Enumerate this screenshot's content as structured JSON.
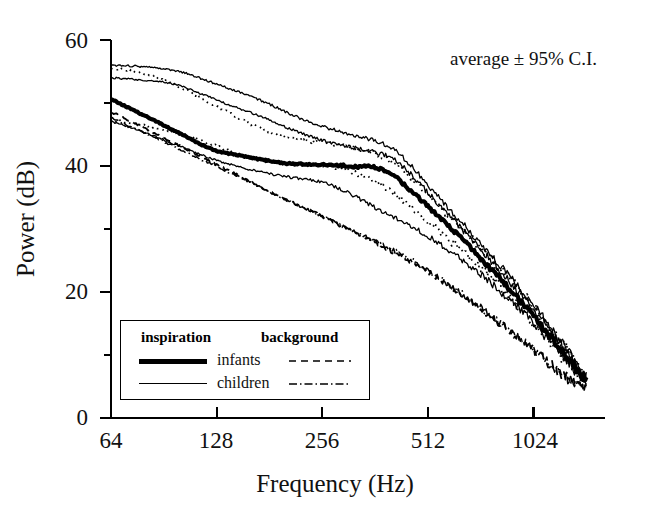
{
  "figure": {
    "annotation": "average ± 95% C.I.",
    "background_color": "#ffffff",
    "ink_color": "#000000"
  },
  "axes": {
    "ylabel": "Power (dB)",
    "xlabel": "Frequency (Hz)",
    "y_ticks": [
      "60",
      "40",
      "20",
      "0"
    ],
    "x_ticks": [
      "64",
      "128",
      "256",
      "512",
      "1024"
    ]
  },
  "legend": {
    "header_left": "inspiration",
    "header_right": "background",
    "rows": [
      {
        "name": "infants",
        "inspiration_style": "thick-solid",
        "background_style": "dashed"
      },
      {
        "name": "children",
        "inspiration_style": "thin-solid",
        "background_style": "dash-dot"
      }
    ]
  },
  "chart_data": {
    "type": "line",
    "title": "",
    "xlabel": "Frequency (Hz)",
    "ylabel": "Power (dB)",
    "xscale": "log2",
    "xlim": [
      64,
      1450
    ],
    "ylim": [
      0,
      60
    ],
    "yticks": [
      0,
      20,
      40,
      60
    ],
    "yticks_minor": [
      10,
      30,
      50
    ],
    "xticks": [
      64,
      128,
      256,
      512,
      1024
    ],
    "grid": false,
    "legend_position": "lower-left",
    "annotation": "average ± 95% C.I.",
    "x": [
      64,
      72,
      81,
      91,
      102,
      114,
      128,
      144,
      161,
      181,
      203,
      228,
      256,
      287,
      322,
      362,
      406,
      456,
      512,
      574,
      645,
      724,
      812,
      912,
      1024,
      1149,
      1290,
      1448
    ],
    "series": [
      {
        "name": "infants inspiration (average)",
        "style": "thick-solid",
        "values": [
          50.5,
          49.2,
          47.8,
          46.4,
          45.0,
          43.6,
          42.4,
          41.8,
          41.3,
          40.8,
          40.4,
          40.3,
          40.2,
          40.1,
          39.9,
          39.8,
          38.6,
          36.2,
          33.6,
          30.9,
          28.2,
          25.3,
          22.4,
          19.4,
          16.1,
          12.8,
          9.3,
          6.2
        ]
      },
      {
        "name": "infants inspiration upper 95% C.I.",
        "style": "dotted",
        "values": [
          55.5,
          55.2,
          54.6,
          53.6,
          52.4,
          51.0,
          49.5,
          48.0,
          46.6,
          45.4,
          44.5,
          44.0,
          43.7,
          43.3,
          42.8,
          42.0,
          40.6,
          38.2,
          35.5,
          32.6,
          29.8,
          26.9,
          24.0,
          20.9,
          17.5,
          14.1,
          10.4,
          7.0
        ]
      },
      {
        "name": "infants inspiration lower 95% C.I.",
        "style": "dotted",
        "values": [
          47.2,
          46.9,
          46.4,
          45.8,
          45.1,
          44.2,
          43.2,
          42.2,
          41.3,
          40.7,
          40.4,
          40.2,
          40.0,
          39.6,
          38.8,
          37.6,
          35.8,
          33.6,
          31.2,
          28.8,
          26.4,
          23.9,
          21.2,
          18.4,
          15.2,
          12.0,
          8.6,
          5.6
        ]
      },
      {
        "name": "children inspiration (average)",
        "style": "thin-solid",
        "values": [
          54.0,
          53.8,
          53.6,
          53.3,
          52.6,
          51.6,
          50.5,
          49.4,
          48.4,
          47.3,
          46.1,
          45.0,
          44.1,
          43.4,
          42.8,
          42.2,
          41.2,
          38.8,
          35.8,
          32.8,
          29.8,
          26.8,
          23.8,
          20.6,
          17.2,
          13.8,
          10.0,
          6.6
        ]
      },
      {
        "name": "children inspiration upper 95% C.I.",
        "style": "thin-solid",
        "values": [
          56.0,
          55.9,
          55.7,
          55.4,
          54.9,
          54.0,
          53.0,
          52.0,
          51.0,
          49.8,
          48.5,
          47.3,
          46.3,
          45.5,
          44.8,
          44.0,
          42.8,
          40.2,
          37.0,
          33.9,
          30.8,
          27.7,
          24.6,
          21.3,
          17.8,
          14.3,
          10.4,
          6.9
        ]
      },
      {
        "name": "children inspiration lower 95% C.I.",
        "style": "thin-solid",
        "values": [
          47.0,
          46.2,
          45.2,
          44.1,
          43.0,
          41.9,
          40.9,
          40.1,
          39.4,
          38.8,
          38.3,
          37.9,
          37.4,
          36.4,
          35.0,
          33.4,
          32.0,
          30.6,
          28.9,
          27.0,
          25.0,
          22.8,
          20.4,
          17.8,
          15.0,
          12.0,
          8.8,
          5.8
        ]
      },
      {
        "name": "infants background",
        "style": "dashed",
        "values": [
          48.5,
          47.2,
          45.8,
          44.4,
          43.0,
          41.6,
          40.2,
          38.8,
          37.4,
          36.0,
          34.6,
          33.3,
          32.0,
          30.6,
          29.2,
          27.8,
          26.4,
          24.9,
          23.2,
          21.3,
          19.4,
          17.4,
          15.3,
          13.1,
          10.8,
          8.4,
          6.2,
          4.8
        ]
      },
      {
        "name": "children background",
        "style": "dash-dot",
        "values": [
          47.6,
          46.4,
          45.1,
          43.8,
          42.5,
          41.2,
          39.9,
          38.6,
          37.3,
          35.9,
          34.6,
          33.3,
          32.0,
          30.7,
          29.4,
          28.1,
          26.7,
          25.2,
          23.5,
          21.6,
          19.6,
          17.6,
          15.4,
          13.2,
          10.9,
          8.5,
          6.3,
          4.9
        ]
      }
    ]
  }
}
